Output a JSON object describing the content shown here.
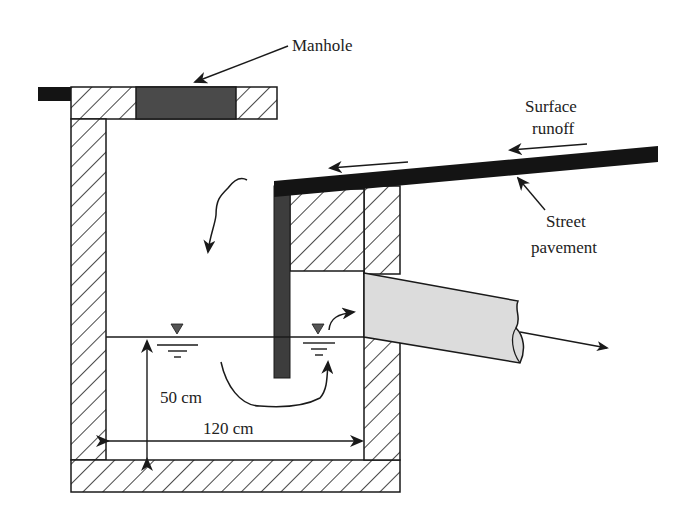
{
  "figure": {
    "type": "schematic"
  },
  "labels": {
    "manhole": "Manhole",
    "surface_runoff_line1": "Surface",
    "surface_runoff_line2": "runoff",
    "street_line1": "Street",
    "street_line2": "pavement",
    "depth_dim": "50 cm",
    "width_dim": "120 cm"
  },
  "colors": {
    "line": "#1a1a1a",
    "solid_dark": "#141414",
    "cover_fill": "#4a4a4a",
    "baffle_fill": "#3d3d3d",
    "pipe_fill": "#dcdcdc",
    "water_marker": "#555555",
    "background": "#ffffff"
  }
}
